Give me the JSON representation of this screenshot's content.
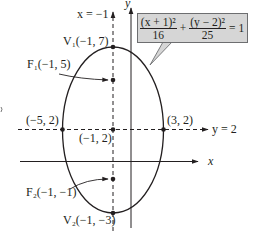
{
  "figure": {
    "type": "ellipse-graph",
    "equation": {
      "term1_numerator": "(x + 1)²",
      "term1_denominator": "16",
      "plus": "+",
      "term2_numerator": "(y − 2)²",
      "term2_denominator": "25",
      "equals": "= 1"
    },
    "axes": {
      "x_label": "x",
      "y_label": "y"
    },
    "lines": {
      "vertical_dashed": "x = −1",
      "horizontal_dashed": "y = 2"
    },
    "points": {
      "v1": "V₁(−1, 7)",
      "f1": "F₁(−1, 5)",
      "left_vertex": "(−5, 2)",
      "center": "(−1, 2)",
      "right_vertex": "(3, 2)",
      "f2": "F₂(−1, −1)",
      "v2": "V₂(−1, −3)"
    },
    "colors": {
      "ink": "#231f20",
      "box_fill": "#d6d6d6",
      "box_border": "#6d6e70"
    }
  }
}
